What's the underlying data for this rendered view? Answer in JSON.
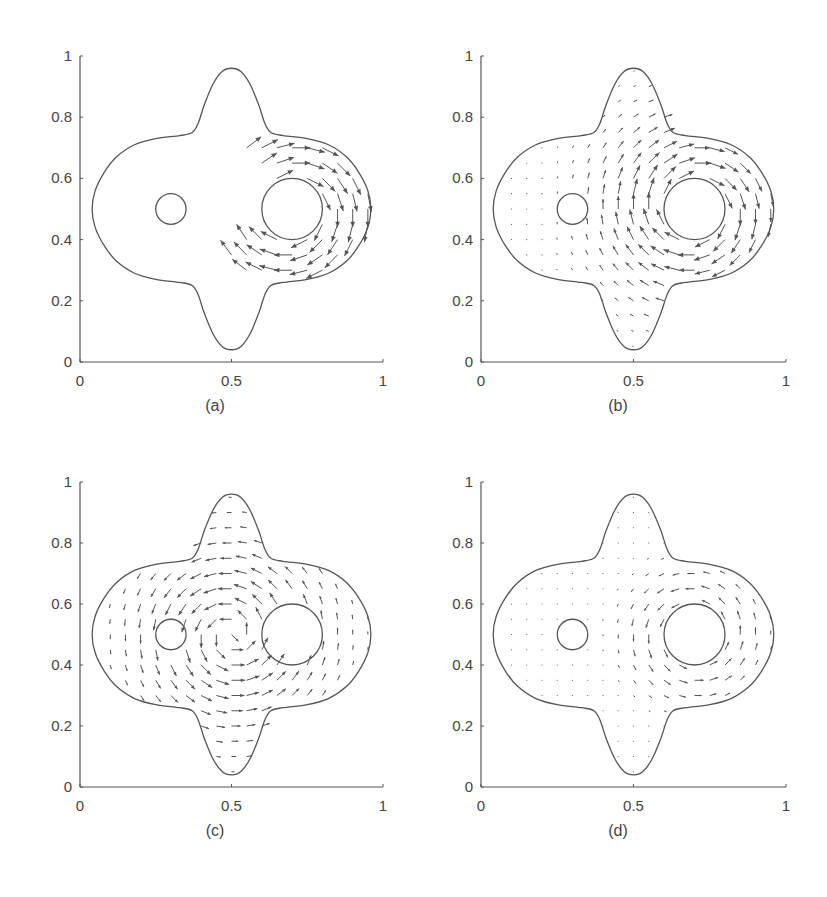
{
  "figure": {
    "background": "#ffffff",
    "line_color": "#555555",
    "arrow_color": "#555555",
    "text_color": "#444444"
  },
  "chart_data": [
    {
      "id": "a",
      "type": "quiver",
      "caption": "(a)",
      "xlim": [
        0,
        1
      ],
      "ylim": [
        0,
        1
      ],
      "xticks": [
        0,
        0.5,
        1
      ],
      "xtick_labels": [
        "0",
        "0.5",
        "1"
      ],
      "yticks": [
        0,
        0.2,
        0.4,
        0.6,
        0.8,
        1
      ],
      "ytick_labels": [
        "0",
        "0.2",
        "0.4",
        "0.6",
        "0.8",
        "1"
      ],
      "grid": false,
      "domain_boundary": "four-lobed shape: top (0.5,0.96), bottom (0.5,0.04), left (0.04,0.5), right (0.96,0.5)",
      "obstacles": [
        {
          "cx": 0.3,
          "cy": 0.5,
          "r": 0.05
        },
        {
          "cx": 0.7,
          "cy": 0.5,
          "r": 0.1
        }
      ],
      "field": {
        "kind": "crescent",
        "cx": 0.7,
        "cy": 0.5,
        "rin": 0.1,
        "rout": 0.26,
        "scale": 1.0,
        "region": "right side of large circle, clockwise sweep from top to bottom-left"
      }
    },
    {
      "id": "b",
      "type": "quiver",
      "caption": "(b)",
      "xlim": [
        0,
        1
      ],
      "ylim": [
        0,
        1
      ],
      "xticks": [
        0,
        0.5,
        1
      ],
      "xtick_labels": [
        "0",
        "0.5",
        "1"
      ],
      "yticks": [
        0,
        0.2,
        0.4,
        0.6,
        0.8,
        1
      ],
      "ytick_labels": [
        "0",
        "0.2",
        "0.4",
        "0.6",
        "0.8",
        "1"
      ],
      "grid": false,
      "obstacles": [
        {
          "cx": 0.3,
          "cy": 0.5,
          "r": 0.05
        },
        {
          "cx": 0.7,
          "cy": 0.5,
          "r": 0.1
        }
      ],
      "field": {
        "kind": "vortex",
        "cx": 0.7,
        "cy": 0.5,
        "direction": "clockwise",
        "scale": 0.55,
        "decay": 0.22
      }
    },
    {
      "id": "c",
      "type": "quiver",
      "caption": "(c)",
      "xlim": [
        0,
        1
      ],
      "ylim": [
        0,
        1
      ],
      "xticks": [
        0,
        0.5,
        1
      ],
      "xtick_labels": [
        "0",
        "0.5",
        "1"
      ],
      "yticks": [
        0,
        0.2,
        0.4,
        0.6,
        0.8,
        1
      ],
      "ytick_labels": [
        "0",
        "0.2",
        "0.4",
        "0.6",
        "0.8",
        "1"
      ],
      "grid": false,
      "obstacles": [
        {
          "cx": 0.3,
          "cy": 0.5,
          "r": 0.05
        },
        {
          "cx": 0.7,
          "cy": 0.5,
          "r": 0.1
        }
      ],
      "field": {
        "kind": "vortex",
        "cx": 0.5,
        "cy": 0.5,
        "direction": "counterclockwise",
        "scale": 0.45,
        "decay": 0.25
      }
    },
    {
      "id": "d",
      "type": "quiver",
      "caption": "(d)",
      "xlim": [
        0,
        1
      ],
      "ylim": [
        0,
        1
      ],
      "xticks": [
        0,
        0.5,
        1
      ],
      "xtick_labels": [
        "0",
        "0.5",
        "1"
      ],
      "yticks": [
        0,
        0.2,
        0.4,
        0.6,
        0.8,
        1
      ],
      "ytick_labels": [
        "0",
        "0.2",
        "0.4",
        "0.6",
        "0.8",
        "1"
      ],
      "grid": false,
      "obstacles": [
        {
          "cx": 0.3,
          "cy": 0.5,
          "r": 0.05
        },
        {
          "cx": 0.7,
          "cy": 0.5,
          "r": 0.1
        }
      ],
      "field": {
        "kind": "vortex",
        "cx": 0.7,
        "cy": 0.5,
        "direction": "counterclockwise",
        "scale": 0.3,
        "decay": 0.12
      }
    }
  ],
  "panels_layout": [
    {
      "left": 80,
      "top": 56,
      "width": 303,
      "height": 306,
      "caption_x": 185,
      "caption_y": 397
    },
    {
      "left": 481,
      "top": 56,
      "width": 305,
      "height": 306,
      "caption_x": 588,
      "caption_y": 397
    },
    {
      "left": 80,
      "top": 482,
      "width": 303,
      "height": 305,
      "caption_x": 185,
      "caption_y": 822
    },
    {
      "left": 481,
      "top": 482,
      "width": 305,
      "height": 305,
      "caption_x": 588,
      "caption_y": 822
    }
  ]
}
